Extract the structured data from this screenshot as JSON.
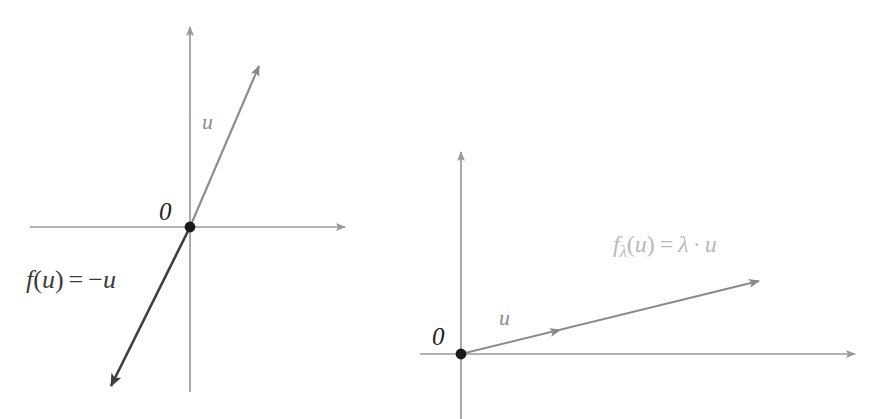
{
  "figure": {
    "background_color": "#ffffff",
    "panels": [
      {
        "id": "left-panel",
        "name": "reflection-diagram",
        "origin_label": "0",
        "vector_label": "u",
        "formula_text": "f(u) = −u",
        "formula_parts": {
          "f": "f",
          "open_paren": "(",
          "arg": "u",
          "close_paren": ")",
          "equals": "=",
          "minus": "−",
          "result": "u"
        },
        "colors": {
          "axis": "#9a9a9a",
          "vector_u": "#8a8a8a",
          "image_line": "#3f3f3f",
          "origin_dot": "#1a1a1a",
          "label_u": "#8c8c8c",
          "label_origin": "#222222",
          "label_formula": "#3a3a3a"
        },
        "geometry": {
          "origin": [
            190,
            227
          ],
          "x_axis": [
            30,
            227,
            352,
            227
          ],
          "y_axis": [
            190,
            392,
            190,
            20
          ],
          "vector_u_tip": [
            265,
            58
          ],
          "image_tip": [
            104,
            396
          ]
        }
      },
      {
        "id": "right-panel",
        "name": "scaling-diagram",
        "origin_label": "0",
        "vector_label": "u",
        "formula_text": "fλ(u) = λ · u",
        "formula_parts": {
          "f": "f",
          "lambda_sub": "λ",
          "open_paren": "(",
          "arg": "u",
          "close_paren": ")",
          "equals": "=",
          "lambda": "λ",
          "dot": "·",
          "result": "u"
        },
        "colors": {
          "axis": "#9a9a9a",
          "vector_u": "#8a8a8a",
          "image_line": "#8a8a8a",
          "origin_dot": "#1a1a1a",
          "label_u": "#8c8c8c",
          "label_origin": "#222222",
          "label_formula": "#b9b9b9"
        },
        "geometry": {
          "origin": [
            461,
            354
          ],
          "x_axis": [
            420,
            354,
            862,
            354
          ],
          "y_axis": [
            461,
            419,
            461,
            145
          ],
          "vector_u_tip": [
            556,
            331
          ],
          "image_tip": [
            766,
            275
          ]
        }
      }
    ],
    "labels": {
      "origin": "0",
      "u": "u"
    }
  }
}
